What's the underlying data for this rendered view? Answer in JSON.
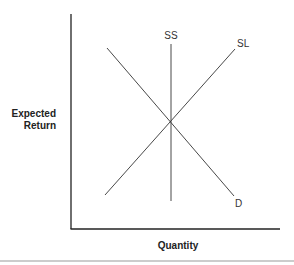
{
  "diagram": {
    "type": "supply-demand",
    "y_axis_label_line1": "Expected",
    "y_axis_label_line2": "Return",
    "x_axis_label": "Quantity",
    "curves": [
      {
        "name": "SS",
        "label": "SS",
        "shape": "vertical line",
        "description": "short-run supply"
      },
      {
        "name": "SL",
        "label": "SL",
        "shape": "upward sloping line",
        "description": "long-run supply"
      },
      {
        "name": "D",
        "label": "D",
        "shape": "downward sloping line",
        "description": "demand"
      }
    ],
    "intersection": "all three curves intersect at a single equilibrium point",
    "colors": {
      "lines": "#333333",
      "axes": "#222222",
      "rule": "#999999"
    }
  }
}
